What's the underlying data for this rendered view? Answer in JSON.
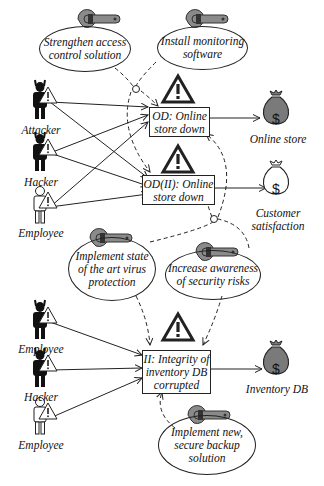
{
  "diagram": {
    "threat_scenarios": [
      {
        "id": "OD",
        "label_line1": "OD: Online",
        "label_line2": "store down",
        "label_line3": ""
      },
      {
        "id": "OD(II)",
        "label_line1": "OD(II): Online",
        "label_line2": "store down",
        "label_line3": ""
      },
      {
        "id": "II",
        "label_line1": "II: Integrity of",
        "label_line2": "inventory DB",
        "label_line3": "corrupted"
      }
    ],
    "threat_agents": [
      {
        "label": "Attacker",
        "kind": "malicious"
      },
      {
        "label": "Hacker",
        "kind": "malicious"
      },
      {
        "label": "Employee",
        "kind": "non-malicious"
      },
      {
        "label": "Employee",
        "kind": "malicious"
      },
      {
        "label": "Hacker",
        "kind": "malicious"
      },
      {
        "label": "Employee",
        "kind": "non-malicious"
      }
    ],
    "assets": [
      {
        "label_line1": "Online store",
        "label_line2": "",
        "fill": "#7a7a7a"
      },
      {
        "label_line1": "Customer",
        "label_line2": "satisfaction",
        "fill": "#ffffff"
      },
      {
        "label_line1": "Inventory DB",
        "label_line2": "",
        "fill": "#7a7a7a"
      }
    ],
    "treatments": [
      {
        "line1": "Strengthen access",
        "line2": "control solution",
        "line3": ""
      },
      {
        "line1": "Install monitoring",
        "line2": "software",
        "line3": ""
      },
      {
        "line1": "Implement state",
        "line2": "of the art virus",
        "line3": "protection"
      },
      {
        "line1": "Increase awareness",
        "line2": "of security risks",
        "line3": ""
      },
      {
        "line1": "Implement new,",
        "line2": "secure backup",
        "line3": "solution"
      }
    ],
    "colors": {
      "line": "#222222",
      "wrench": "#8a8a8a",
      "asset_dark": "#7a7a7a"
    }
  }
}
